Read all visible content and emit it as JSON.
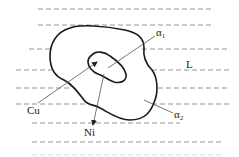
{
  "figure": {
    "labels": {
      "alpha1_base": "α",
      "alpha1_sub": "1",
      "alpha2_base": "α",
      "alpha2_sub": "2",
      "liquid": "L",
      "copper": "Cu",
      "nickel": "Ni"
    },
    "regions": [
      {
        "name": "alpha1",
        "meaning": "inner solid core (first solidified)"
      },
      {
        "name": "alpha2",
        "meaning": "outer solid layer"
      },
      {
        "name": "liquid",
        "meaning": "surrounding liquid, shown with dashed lines"
      }
    ],
    "arrows": [
      {
        "label": "Cu",
        "direction": "toward inner core"
      },
      {
        "label": "Ni",
        "direction": "outward from inner core"
      }
    ]
  }
}
